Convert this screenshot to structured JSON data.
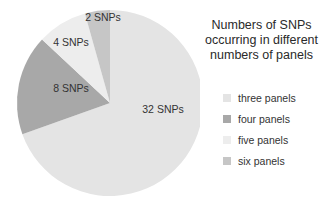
{
  "chart_data": {
    "type": "pie",
    "title": "Numbers of SNPs occurring in different numbers of panels",
    "title_lines": [
      "Numbers of SNPs",
      "occurring in different",
      "numbers of panels"
    ],
    "categories": [
      "three panels",
      "four panels",
      "five panels",
      "six panels"
    ],
    "values": [
      32,
      8,
      4,
      2
    ],
    "data_labels": [
      "32 SNPs",
      "8 SNPs",
      "4 SNPs",
      "2 SNPs"
    ],
    "colors": [
      "#e4e4e4",
      "#a8a8a8",
      "#ededed",
      "#c6c6c6"
    ],
    "legend_position": "right",
    "start_angle": "12 o'clock, clockwise"
  }
}
